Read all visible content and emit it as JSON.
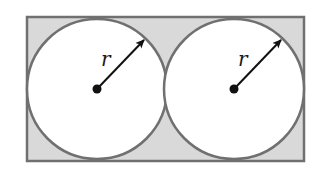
{
  "diagram": {
    "colors": {
      "background": "#ffffff",
      "shaded_region": "#d9d9d9",
      "outline": "#707070",
      "circle_fill": "#ffffff",
      "radius_line": "#111111"
    },
    "rectangle": {
      "x": 27,
      "y": 17,
      "width": 277,
      "height": 144
    },
    "circles": [
      {
        "id": "left",
        "cx": 97,
        "cy": 89,
        "r": 70,
        "radius_label": "r",
        "label_x": 101,
        "label_y": 66,
        "arrow_tip_x": 144,
        "arrow_tip_y": 40
      },
      {
        "id": "right",
        "cx": 234,
        "cy": 89,
        "r": 70,
        "radius_label": "r",
        "label_x": 238,
        "label_y": 66,
        "arrow_tip_x": 281,
        "arrow_tip_y": 40
      }
    ]
  }
}
